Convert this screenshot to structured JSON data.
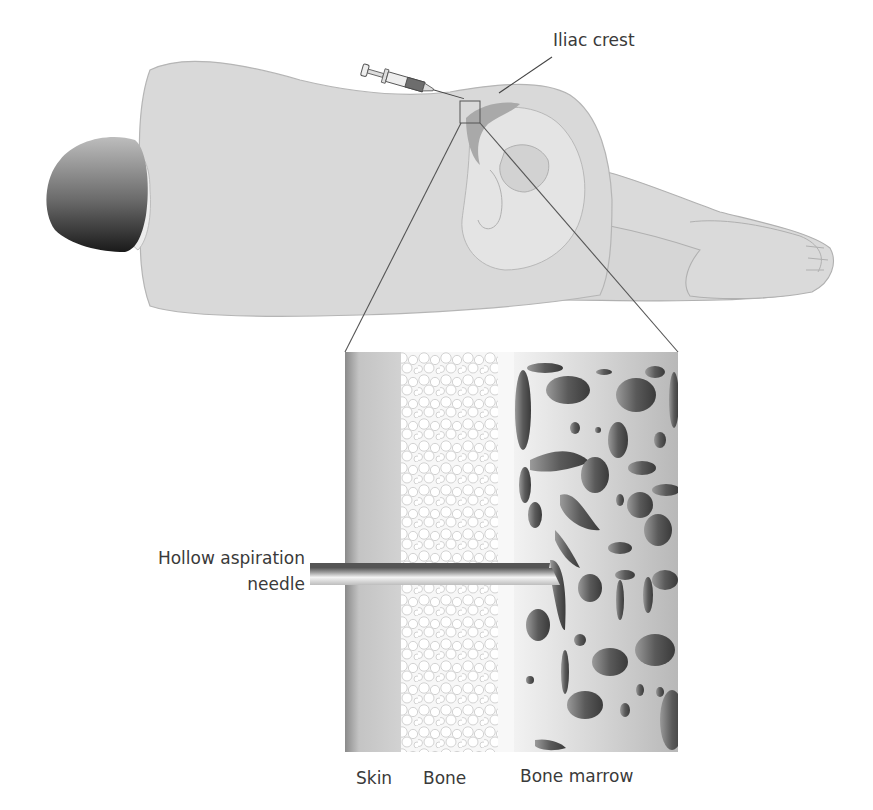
{
  "figure": {
    "labels": {
      "iliac_crest": "Iliac crest",
      "needle_line1": "Hollow aspiration",
      "needle_line2": "needle",
      "skin": "Skin",
      "bone": "Bone",
      "bone_marrow": "Bone marrow"
    },
    "colors": {
      "body_fill": "#d9d9d9",
      "body_stroke": "#b5b5b5",
      "head_dark": "#2b2b2b",
      "bone_fill": "#e6e6e6",
      "iliac_band": "#a9a9a9",
      "skin_layer": "#c9c9c9",
      "marrow_bg": "#dcdcdc",
      "marrow_holes": "#5e5e5e",
      "leader_line": "#444444",
      "text": "#3a3a3a"
    }
  }
}
